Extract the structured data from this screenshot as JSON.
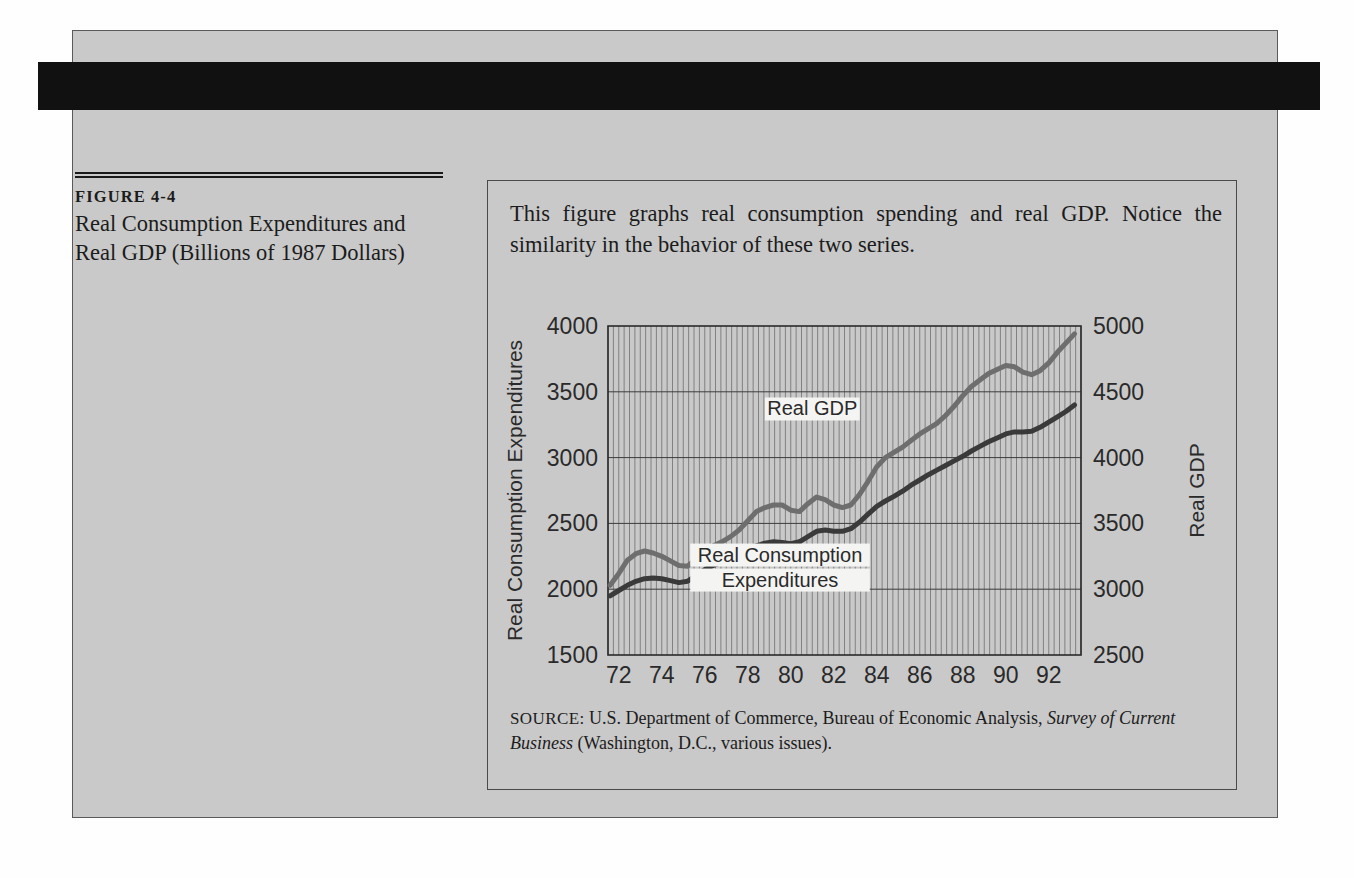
{
  "figure": {
    "label": "FIGURE 4-4",
    "title": "Real Consumption Expenditures and Real GDP (Billions of 1987 Dollars)",
    "description": "This figure graphs real consumption spending and real GDP. Notice the similarity in the behavior of these two series.",
    "source_prefix": "SOURCE:",
    "source_text": "U.S. Department of Commerce, Bureau of Economic Analysis,",
    "source_italic": "Survey of Current Business",
    "source_tail": "(Washington, D.C., various issues)."
  },
  "colors": {
    "panel_background": "#c9c9c9",
    "banner": "#111111",
    "consumption_line": "#3a3a3a",
    "gdp_line": "#6e6e6e",
    "grid": "#6b6b6b",
    "axis": "#2a2a2a"
  },
  "chart_data": {
    "type": "line",
    "title": "",
    "xlabel": "",
    "ylabel": "Real Consumption Expenditures",
    "y2label": "Real GDP",
    "xlim": [
      71.5,
      93.5
    ],
    "ylim": [
      1500,
      4000
    ],
    "y2lim": [
      2500,
      5000
    ],
    "xticks": [
      "72",
      "74",
      "76",
      "78",
      "80",
      "82",
      "84",
      "86",
      "88",
      "90",
      "92"
    ],
    "xtick_values": [
      72,
      74,
      76,
      78,
      80,
      82,
      84,
      86,
      88,
      90,
      92
    ],
    "yticks": [
      "1500",
      "2000",
      "2500",
      "3000",
      "3500",
      "4000"
    ],
    "ytick_values": [
      1500,
      2000,
      2500,
      3000,
      3500,
      4000
    ],
    "y2ticks": [
      "2500",
      "3000",
      "3500",
      "4000",
      "4500",
      "5000"
    ],
    "y2tick_values": [
      2500,
      3000,
      3500,
      4000,
      4500,
      5000
    ],
    "grid": "dense vertical quarterly lines plus horizontal gridlines at each y tick",
    "legend_position": "inline-labels",
    "annotations": [
      {
        "text": "Real GDP",
        "x": 81.0,
        "y_left_axis": 3320
      },
      {
        "text": "Real Consumption Expenditures",
        "x": 79.5,
        "y_left_axis": 2210
      }
    ],
    "x": [
      71.6,
      72.0,
      72.4,
      72.8,
      73.2,
      73.6,
      74.0,
      74.4,
      74.8,
      75.2,
      75.6,
      76.0,
      76.4,
      76.8,
      77.2,
      77.6,
      78.0,
      78.4,
      78.8,
      79.2,
      79.6,
      80.0,
      80.4,
      80.8,
      81.2,
      81.6,
      82.0,
      82.4,
      82.8,
      83.2,
      83.6,
      84.0,
      84.4,
      84.8,
      85.2,
      85.6,
      86.0,
      86.4,
      86.8,
      87.2,
      87.6,
      88.0,
      88.4,
      88.8,
      89.2,
      89.6,
      90.0,
      90.4,
      90.8,
      91.2,
      91.6,
      92.0,
      92.4,
      92.8,
      93.2
    ],
    "series": [
      {
        "name": "Real GDP",
        "axis": "right",
        "units": "Billions of 1987 dollars",
        "values_right_axis": [
          3030,
          3120,
          3220,
          3270,
          3290,
          3275,
          3250,
          3215,
          3180,
          3175,
          3230,
          3290,
          3330,
          3360,
          3400,
          3450,
          3520,
          3590,
          3620,
          3640,
          3640,
          3600,
          3590,
          3650,
          3700,
          3680,
          3640,
          3620,
          3640,
          3720,
          3820,
          3930,
          4000,
          4040,
          4080,
          4130,
          4180,
          4220,
          4260,
          4320,
          4390,
          4470,
          4540,
          4590,
          4640,
          4670,
          4700,
          4690,
          4650,
          4630,
          4660,
          4720,
          4800,
          4870,
          4940
        ]
      },
      {
        "name": "Real Consumption Expenditures",
        "axis": "left",
        "units": "Billions of 1987 dollars",
        "values_left_axis": [
          1950,
          1990,
          2030,
          2060,
          2080,
          2085,
          2080,
          2065,
          2050,
          2060,
          2105,
          2150,
          2180,
          2205,
          2230,
          2265,
          2300,
          2330,
          2350,
          2360,
          2355,
          2345,
          2360,
          2400,
          2440,
          2450,
          2440,
          2440,
          2460,
          2510,
          2570,
          2630,
          2670,
          2705,
          2745,
          2790,
          2830,
          2870,
          2905,
          2940,
          2975,
          3010,
          3050,
          3085,
          3120,
          3150,
          3180,
          3195,
          3195,
          3200,
          3230,
          3270,
          3310,
          3350,
          3400
        ]
      }
    ]
  }
}
